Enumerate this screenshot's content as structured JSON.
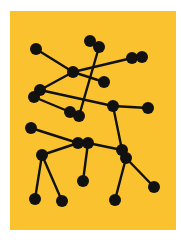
{
  "artwork": {
    "background": "#ffffff",
    "panel": {
      "x": 10,
      "y": 11,
      "width": 166,
      "height": 219,
      "color": "#F9C22E"
    },
    "ink": "#111111",
    "node_radius": 6,
    "line_width": 2.4,
    "nodes": [
      {
        "id": "A",
        "x": 36,
        "y": 49
      },
      {
        "id": "B",
        "x": 90,
        "y": 41
      },
      {
        "id": "C",
        "x": 99,
        "y": 47
      },
      {
        "id": "D",
        "x": 73,
        "y": 72
      },
      {
        "id": "E",
        "x": 132,
        "y": 58
      },
      {
        "id": "F",
        "x": 142,
        "y": 57
      },
      {
        "id": "G",
        "x": 104,
        "y": 82
      },
      {
        "id": "H",
        "x": 40,
        "y": 90
      },
      {
        "id": "I",
        "x": 34,
        "y": 97
      },
      {
        "id": "J",
        "x": 70,
        "y": 112
      },
      {
        "id": "K",
        "x": 79,
        "y": 116
      },
      {
        "id": "L",
        "x": 113,
        "y": 106
      },
      {
        "id": "M",
        "x": 148,
        "y": 108
      },
      {
        "id": "N",
        "x": 31,
        "y": 128
      },
      {
        "id": "O",
        "x": 78,
        "y": 143
      },
      {
        "id": "P",
        "x": 88,
        "y": 143
      },
      {
        "id": "Q",
        "x": 122,
        "y": 150
      },
      {
        "id": "R",
        "x": 126,
        "y": 158
      },
      {
        "id": "S",
        "x": 42,
        "y": 155
      },
      {
        "id": "T",
        "x": 83,
        "y": 181
      },
      {
        "id": "U",
        "x": 154,
        "y": 187
      },
      {
        "id": "V",
        "x": 35,
        "y": 199
      },
      {
        "id": "W",
        "x": 62,
        "y": 201
      },
      {
        "id": "X",
        "x": 115,
        "y": 200
      }
    ],
    "edges": [
      [
        "A",
        "D"
      ],
      [
        "D",
        "G"
      ],
      [
        "C",
        "K"
      ],
      [
        "B",
        "C"
      ],
      [
        "D",
        "E"
      ],
      [
        "E",
        "F"
      ],
      [
        "D",
        "H"
      ],
      [
        "H",
        "I"
      ],
      [
        "I",
        "J"
      ],
      [
        "J",
        "K"
      ],
      [
        "H",
        "L"
      ],
      [
        "L",
        "M"
      ],
      [
        "L",
        "Q"
      ],
      [
        "N",
        "O"
      ],
      [
        "O",
        "P"
      ],
      [
        "P",
        "Q"
      ],
      [
        "Q",
        "R"
      ],
      [
        "O",
        "S"
      ],
      [
        "S",
        "V"
      ],
      [
        "S",
        "W"
      ],
      [
        "P",
        "T"
      ],
      [
        "R",
        "X"
      ],
      [
        "R",
        "U"
      ]
    ]
  }
}
